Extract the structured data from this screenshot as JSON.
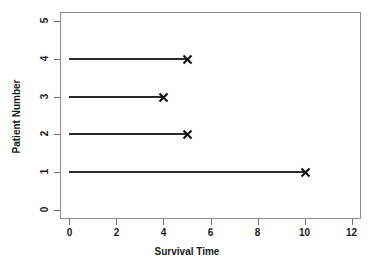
{
  "chart": {
    "title": "",
    "xlabel": "Survival Time",
    "ylabel": "Patient Number",
    "xticks": [
      "0",
      "2",
      "4",
      "6",
      "8",
      "10",
      "12"
    ],
    "yticks": [
      "0",
      "1",
      "2",
      "3",
      "4",
      "5"
    ],
    "marker_name": "x-event-marker",
    "line_color": "#2b2b2b",
    "axis_color": "#8d8d8d",
    "text_color": "#1a1a1a",
    "background": "#ffffff"
  },
  "chart_data": {
    "type": "line",
    "title": "",
    "xlabel": "Survival Time",
    "ylabel": "Patient Number",
    "xlim": [
      -0.4,
      12.4
    ],
    "ylim": [
      -0.25,
      5.25
    ],
    "xticks": [
      0,
      2,
      4,
      6,
      8,
      10,
      12
    ],
    "yticks": [
      0,
      1,
      2,
      3,
      4,
      5
    ],
    "grid": false,
    "legend": null,
    "marker": "x",
    "series": [
      {
        "name": "Patient 1",
        "patient": 1,
        "start": 0,
        "end": 10,
        "event": true
      },
      {
        "name": "Patient 2",
        "patient": 2,
        "start": 0,
        "end": 5,
        "event": true
      },
      {
        "name": "Patient 3",
        "patient": 3,
        "start": 0,
        "end": 4,
        "event": true
      },
      {
        "name": "Patient 4",
        "patient": 4,
        "start": 0,
        "end": 5,
        "event": true
      }
    ],
    "categories": [
      1,
      2,
      3,
      4
    ],
    "values": [
      10,
      5,
      4,
      5
    ]
  }
}
